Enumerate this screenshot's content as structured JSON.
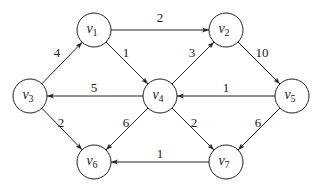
{
  "graph": {
    "directed": true,
    "node_radius": 17,
    "nodes": [
      {
        "id": "v1",
        "letter": "v",
        "sub": "1",
        "x": 94,
        "y": 30
      },
      {
        "id": "v2",
        "letter": "v",
        "sub": "2",
        "x": 226,
        "y": 30
      },
      {
        "id": "v3",
        "letter": "v",
        "sub": "3",
        "x": 30,
        "y": 96
      },
      {
        "id": "v4",
        "letter": "v",
        "sub": "4",
        "x": 160,
        "y": 96
      },
      {
        "id": "v5",
        "letter": "v",
        "sub": "5",
        "x": 292,
        "y": 96
      },
      {
        "id": "v6",
        "letter": "v",
        "sub": "6",
        "x": 94,
        "y": 162
      },
      {
        "id": "v7",
        "letter": "v",
        "sub": "7",
        "x": 226,
        "y": 162
      }
    ],
    "edges": [
      {
        "from": "v3",
        "to": "v1",
        "weight": "4",
        "lx": 57,
        "ly": 57
      },
      {
        "from": "v1",
        "to": "v2",
        "weight": "2",
        "lx": 160,
        "ly": 22
      },
      {
        "from": "v1",
        "to": "v4",
        "weight": "1",
        "lx": 126,
        "ly": 57
      },
      {
        "from": "v4",
        "to": "v2",
        "weight": "3",
        "lx": 192,
        "ly": 57
      },
      {
        "from": "v2",
        "to": "v5",
        "weight": "10",
        "lx": 262,
        "ly": 57
      },
      {
        "from": "v4",
        "to": "v3",
        "weight": "5",
        "lx": 94,
        "ly": 92
      },
      {
        "from": "v5",
        "to": "v4",
        "weight": "1",
        "lx": 226,
        "ly": 92
      },
      {
        "from": "v3",
        "to": "v6",
        "weight": "2",
        "lx": 61,
        "ly": 127
      },
      {
        "from": "v4",
        "to": "v6",
        "weight": "6",
        "lx": 126,
        "ly": 127
      },
      {
        "from": "v4",
        "to": "v7",
        "weight": "2",
        "lx": 194,
        "ly": 127
      },
      {
        "from": "v5",
        "to": "v7",
        "weight": "6",
        "lx": 258,
        "ly": 127
      },
      {
        "from": "v7",
        "to": "v6",
        "weight": "1",
        "lx": 160,
        "ly": 158
      }
    ]
  }
}
